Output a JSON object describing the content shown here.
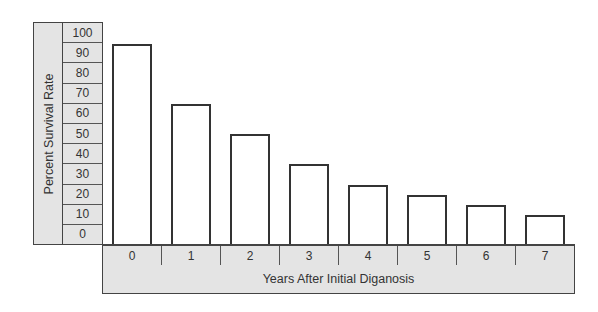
{
  "chart_data": {
    "type": "bar",
    "title": "",
    "xlabel": "Years After Initial Diganosis",
    "ylabel": "Percent Survival Rate",
    "categories": [
      "0",
      "1",
      "2",
      "3",
      "4",
      "5",
      "6",
      "7"
    ],
    "values": [
      95,
      65,
      50,
      35,
      25,
      20,
      15,
      10
    ],
    "y_ticks": [
      "100",
      "90",
      "80",
      "70",
      "60",
      "50",
      "40",
      "30",
      "20",
      "10",
      "0"
    ],
    "ylim": [
      0,
      100
    ],
    "grid": false,
    "legend": null,
    "colors": {
      "bar_fill": "#ffffff",
      "bar_border": "#333333",
      "axis_fill": "#e4e4e4",
      "text": "#333333"
    }
  }
}
